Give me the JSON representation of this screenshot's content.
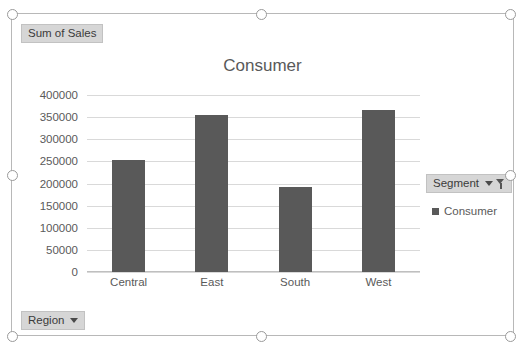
{
  "chart_object": {
    "value_field_label": "Sum of Sales",
    "row_field_label": "Region",
    "legend_field_label": "Segment",
    "caret_icon": "chevron-down-icon",
    "filter_icon": "filter-icon"
  },
  "legend": {
    "position": "right",
    "entries": [
      {
        "label": "Consumer",
        "color": "#595959"
      }
    ]
  },
  "chart_data": {
    "type": "bar",
    "title": "Consumer",
    "categories": [
      "Central",
      "East",
      "South",
      "West"
    ],
    "values": [
      253000,
      355000,
      192000,
      366000
    ],
    "series": [
      {
        "name": "Consumer",
        "values": [
          253000,
          355000,
          192000,
          366000
        ]
      }
    ],
    "xlabel": "",
    "ylabel": "",
    "ylim": [
      0,
      400000
    ],
    "ytick_step": 50000,
    "yticks": [
      "400000",
      "350000",
      "300000",
      "250000",
      "200000",
      "150000",
      "100000",
      "50000",
      "0"
    ],
    "grid": true,
    "bar_color": "#595959",
    "gridline_color": "#d9d9d9",
    "legend_position": "right"
  }
}
